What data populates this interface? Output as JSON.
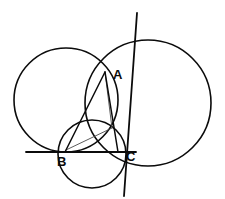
{
  "figure": {
    "kind": "euclidean-geometry-diagram",
    "width": 225,
    "height": 199,
    "background_color": "#ffffff",
    "stroke_color": "#0b0b0b",
    "thin_stroke_color": "#4a4a4a",
    "points": [
      {
        "id": "A",
        "label": "A",
        "x": 105,
        "y": 72,
        "label_x": 113,
        "label_y": 76
      },
      {
        "id": "B",
        "label": "B",
        "x": 65,
        "y": 152,
        "label_x": 57,
        "label_y": 163
      },
      {
        "id": "C",
        "label": "C",
        "x": 118,
        "y": 152,
        "label_x": 126,
        "label_y": 158
      }
    ],
    "circles": [
      {
        "id": "left-circle",
        "name": "left-circle",
        "cx": 66,
        "cy": 100,
        "r": 52,
        "stroke_width": 1.6
      },
      {
        "id": "right-circle",
        "name": "right-circle",
        "cx": 148,
        "cy": 103,
        "r": 63,
        "stroke_width": 1.6
      },
      {
        "id": "small-circle",
        "name": "bottom-small-circle",
        "cx": 92,
        "cy": 154,
        "r": 34,
        "stroke_width": 1.6
      }
    ],
    "lines": [
      {
        "id": "baseline",
        "name": "horizontal-baseline",
        "x1": 26,
        "y1": 152,
        "x2": 136,
        "y2": 152,
        "stroke_width": 1.8
      },
      {
        "id": "tangent",
        "name": "tangent-line-through-A",
        "x1": 137,
        "y1": 13,
        "x2": 124,
        "y2": 196,
        "stroke_width": 1.8
      },
      {
        "id": "seg-BA",
        "name": "segment-B-to-A",
        "x1": 65,
        "y1": 152,
        "x2": 105,
        "y2": 72,
        "stroke_width": 1.5
      },
      {
        "id": "seg-AC",
        "name": "segment-A-to-C",
        "x1": 105,
        "y1": 72,
        "x2": 118,
        "y2": 152,
        "stroke_width": 1.5
      },
      {
        "id": "seg-BC",
        "name": "segment-B-to-C",
        "x1": 65,
        "y1": 152,
        "x2": 118,
        "y2": 152,
        "stroke_width": 1.5
      },
      {
        "id": "chord-A-P",
        "name": "thin-chord-A-to-intersection",
        "x1": 105,
        "y1": 72,
        "x2": 112,
        "y2": 128,
        "stroke_width": 0.9
      },
      {
        "id": "chord-B-P",
        "name": "thin-chord-B-to-intersection",
        "x1": 66,
        "y1": 150,
        "x2": 112,
        "y2": 128,
        "stroke_width": 0.9
      }
    ],
    "labels": {
      "A": "A",
      "B": "B",
      "C": "C"
    }
  },
  "chart_data": {
    "type": "diagram",
    "title": "",
    "annotations": [
      "A",
      "B",
      "C"
    ]
  }
}
